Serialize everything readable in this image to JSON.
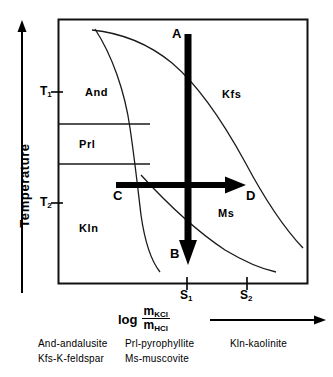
{
  "figure": {
    "axes": {
      "y_title": "Temperature",
      "y_ticks": [
        {
          "label": "T",
          "sub": "1"
        },
        {
          "label": "T",
          "sub": "2"
        }
      ],
      "x_ticks": [
        {
          "label": "S",
          "sub": "1"
        },
        {
          "label": "S",
          "sub": "2"
        }
      ],
      "x_title": {
        "log": "log",
        "numerator": "m",
        "numerator_sub": "KCl",
        "denominator": "m",
        "denominator_sub": "HCl"
      }
    },
    "fields": [
      {
        "name": "And"
      },
      {
        "name": "Prl"
      },
      {
        "name": "Kln"
      },
      {
        "name": "Kfs"
      },
      {
        "name": "Ms"
      }
    ],
    "path_labels": [
      {
        "name": "A"
      },
      {
        "name": "B"
      },
      {
        "name": "C"
      },
      {
        "name": "D"
      }
    ],
    "legend": [
      [
        "And-andalusite",
        "Prl-pyrophyllite",
        "Kln-kaolinite"
      ],
      [
        "Kfs-K-feldspar",
        "Ms-muscovite",
        ""
      ]
    ],
    "colors": {
      "ink": "#000000",
      "curve": "#222222",
      "frame": "#111111"
    }
  }
}
